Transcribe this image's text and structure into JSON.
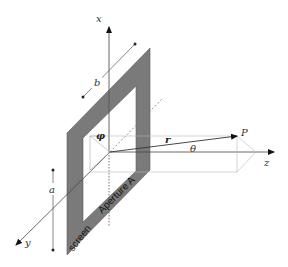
{
  "diagram": {
    "colors": {
      "screen_fill": "#7a7a7a",
      "line": "#444444",
      "dashed": "#999999",
      "background": "#ffffff"
    },
    "labels": {
      "x_axis": "x",
      "y_axis": "y",
      "z_axis": "z",
      "point": "P",
      "radius_vector": "r",
      "angle": "θ",
      "azimuth": "φ",
      "width_dim": "b",
      "height_dim": "a",
      "aperture": "Aperture A",
      "screen": "screen"
    }
  }
}
